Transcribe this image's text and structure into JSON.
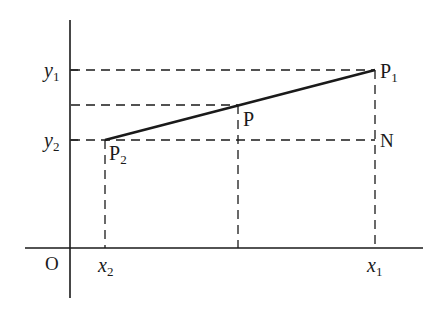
{
  "diagram": {
    "type": "coordinate-geometry",
    "origin_label": "O",
    "axes": {
      "x_ticks": [
        {
          "label": "x",
          "sub": "2",
          "x": 105
        },
        {
          "label": "x",
          "sub": "1",
          "x": 375
        }
      ],
      "y_ticks": [
        {
          "label": "y",
          "sub": "1",
          "y": 70
        },
        {
          "label": "y",
          "sub": "2",
          "y": 140
        }
      ]
    },
    "points": {
      "P1": {
        "label": "P",
        "sub": "1",
        "x": 375,
        "y": 70
      },
      "P": {
        "label": "P",
        "sub": "",
        "x": 238,
        "y": 105
      },
      "P2": {
        "label": "P",
        "sub": "2",
        "x": 105,
        "y": 140
      },
      "N": {
        "label": "N",
        "sub": "",
        "x": 375,
        "y": 140
      }
    },
    "labels": {
      "O": "O",
      "x2": "x",
      "x2_sub": "2",
      "x1": "x",
      "x1_sub": "1",
      "y1": "y",
      "y1_sub": "1",
      "y2": "y",
      "y2_sub": "2",
      "P1": "P",
      "P1_sub": "1",
      "P": "P",
      "P2": "P",
      "P2_sub": "2",
      "N": "N"
    },
    "colors": {
      "line": "#1a1a1a",
      "background": "#ffffff"
    }
  }
}
